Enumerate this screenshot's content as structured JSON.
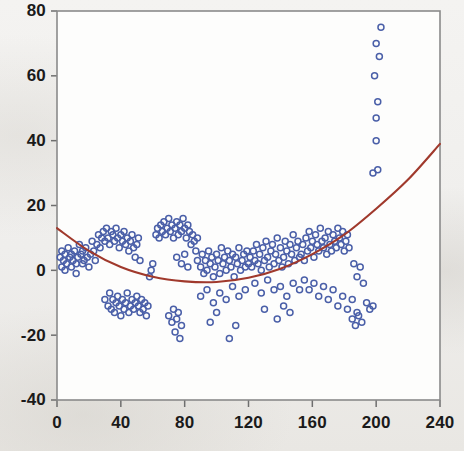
{
  "chart_data": {
    "type": "scatter",
    "title": "",
    "subtitle": "",
    "xlabel": "",
    "ylabel": "",
    "xlim": [
      0,
      240
    ],
    "ylim": [
      -40,
      80
    ],
    "xticks": [
      0,
      40,
      80,
      120,
      160,
      200,
      240
    ],
    "yticks": [
      -40,
      -20,
      0,
      20,
      40,
      60,
      80
    ],
    "xtick_labels": [
      "0",
      "40",
      "80",
      "120",
      "160",
      "200",
      "240"
    ],
    "ytick_labels": [
      "-40",
      "-20",
      "0",
      "20",
      "40",
      "60",
      "80"
    ],
    "grid": false,
    "legend": "none",
    "marker": {
      "shape": "open-circle",
      "color": "#4a5fa8",
      "fill": "none",
      "size_px": 6
    },
    "series": [
      {
        "name": "observations",
        "type": "scatter",
        "color": "#4a5fa8",
        "points": [
          [
            2,
            4
          ],
          [
            3,
            1
          ],
          [
            3,
            6
          ],
          [
            4,
            3
          ],
          [
            5,
            5
          ],
          [
            5,
            0
          ],
          [
            6,
            2
          ],
          [
            7,
            7
          ],
          [
            8,
            4
          ],
          [
            9,
            1
          ],
          [
            9,
            5
          ],
          [
            10,
            3
          ],
          [
            11,
            6
          ],
          [
            12,
            2
          ],
          [
            12,
            -1
          ],
          [
            13,
            4
          ],
          [
            14,
            8
          ],
          [
            15,
            5
          ],
          [
            16,
            2
          ],
          [
            16,
            6
          ],
          [
            17,
            3
          ],
          [
            18,
            7
          ],
          [
            19,
            4
          ],
          [
            20,
            1
          ],
          [
            21,
            5
          ],
          [
            22,
            9
          ],
          [
            23,
            6
          ],
          [
            24,
            3
          ],
          [
            25,
            8
          ],
          [
            26,
            11
          ],
          [
            27,
            7
          ],
          [
            28,
            10
          ],
          [
            29,
            12
          ],
          [
            30,
            9
          ],
          [
            31,
            13
          ],
          [
            32,
            10
          ],
          [
            33,
            8
          ],
          [
            34,
            12
          ],
          [
            35,
            11
          ],
          [
            36,
            9
          ],
          [
            37,
            13
          ],
          [
            38,
            10
          ],
          [
            39,
            7
          ],
          [
            40,
            11
          ],
          [
            41,
            9
          ],
          [
            42,
            12
          ],
          [
            43,
            8
          ],
          [
            44,
            10
          ],
          [
            45,
            6
          ],
          [
            46,
            9
          ],
          [
            47,
            11
          ],
          [
            48,
            7
          ],
          [
            49,
            4
          ],
          [
            50,
            8
          ],
          [
            51,
            10
          ],
          [
            52,
            3
          ],
          [
            30,
            -9
          ],
          [
            32,
            -11
          ],
          [
            33,
            -7
          ],
          [
            34,
            -12
          ],
          [
            35,
            -9
          ],
          [
            36,
            -13
          ],
          [
            37,
            -10
          ],
          [
            38,
            -8
          ],
          [
            39,
            -11
          ],
          [
            40,
            -14
          ],
          [
            41,
            -9
          ],
          [
            42,
            -12
          ],
          [
            43,
            -10
          ],
          [
            44,
            -7
          ],
          [
            45,
            -13
          ],
          [
            46,
            -11
          ],
          [
            47,
            -9
          ],
          [
            48,
            -12
          ],
          [
            49,
            -10
          ],
          [
            50,
            -8
          ],
          [
            51,
            -11
          ],
          [
            52,
            -13
          ],
          [
            53,
            -9
          ],
          [
            54,
            -12
          ],
          [
            55,
            -10
          ],
          [
            56,
            -14
          ],
          [
            57,
            -11
          ],
          [
            58,
            -2
          ],
          [
            59,
            0
          ],
          [
            60,
            2
          ],
          [
            62,
            11
          ],
          [
            63,
            13
          ],
          [
            64,
            10
          ],
          [
            65,
            14
          ],
          [
            66,
            12
          ],
          [
            67,
            15
          ],
          [
            68,
            11
          ],
          [
            69,
            13
          ],
          [
            70,
            16
          ],
          [
            71,
            12
          ],
          [
            72,
            14
          ],
          [
            73,
            10
          ],
          [
            74,
            13
          ],
          [
            75,
            15
          ],
          [
            76,
            11
          ],
          [
            77,
            14
          ],
          [
            78,
            12
          ],
          [
            79,
            16
          ],
          [
            80,
            13
          ],
          [
            81,
            10
          ],
          [
            82,
            14
          ],
          [
            83,
            12
          ],
          [
            84,
            8
          ],
          [
            85,
            11
          ],
          [
            86,
            9
          ],
          [
            87,
            6
          ],
          [
            88,
            10
          ],
          [
            75,
            4
          ],
          [
            78,
            2
          ],
          [
            80,
            5
          ],
          [
            82,
            1
          ],
          [
            70,
            -14
          ],
          [
            72,
            -16
          ],
          [
            73,
            -12
          ],
          [
            74,
            -19
          ],
          [
            75,
            -15
          ],
          [
            76,
            -13
          ],
          [
            77,
            -21
          ],
          [
            78,
            -17
          ],
          [
            88,
            3
          ],
          [
            90,
            1
          ],
          [
            91,
            5
          ],
          [
            92,
            -1
          ],
          [
            93,
            3
          ],
          [
            94,
            0
          ],
          [
            95,
            6
          ],
          [
            96,
            2
          ],
          [
            97,
            4
          ],
          [
            98,
            -2
          ],
          [
            99,
            1
          ],
          [
            100,
            5
          ],
          [
            101,
            3
          ],
          [
            102,
            -1
          ],
          [
            103,
            7
          ],
          [
            104,
            2
          ],
          [
            105,
            4
          ],
          [
            106,
            0
          ],
          [
            107,
            6
          ],
          [
            108,
            3
          ],
          [
            109,
            1
          ],
          [
            110,
            5
          ],
          [
            111,
            -2
          ],
          [
            112,
            4
          ],
          [
            113,
            2
          ],
          [
            114,
            7
          ],
          [
            115,
            0
          ],
          [
            116,
            3
          ],
          [
            117,
            5
          ],
          [
            118,
            1
          ],
          [
            119,
            6
          ],
          [
            120,
            2
          ],
          [
            90,
            -8
          ],
          [
            94,
            -6
          ],
          [
            98,
            -10
          ],
          [
            102,
            -7
          ],
          [
            106,
            -9
          ],
          [
            110,
            -5
          ],
          [
            114,
            -8
          ],
          [
            118,
            -6
          ],
          [
            96,
            -16
          ],
          [
            108,
            -21
          ],
          [
            112,
            -17
          ],
          [
            100,
            -13
          ],
          [
            121,
            4
          ],
          [
            122,
            1
          ],
          [
            123,
            6
          ],
          [
            124,
            3
          ],
          [
            125,
            8
          ],
          [
            126,
            2
          ],
          [
            127,
            5
          ],
          [
            128,
            0
          ],
          [
            129,
            7
          ],
          [
            130,
            3
          ],
          [
            131,
            9
          ],
          [
            132,
            4
          ],
          [
            133,
            1
          ],
          [
            134,
            6
          ],
          [
            135,
            8
          ],
          [
            136,
            2
          ],
          [
            137,
            5
          ],
          [
            138,
            10
          ],
          [
            139,
            3
          ],
          [
            140,
            7
          ],
          [
            141,
            1
          ],
          [
            142,
            4
          ],
          [
            143,
            9
          ],
          [
            144,
            6
          ],
          [
            145,
            2
          ],
          [
            146,
            8
          ],
          [
            147,
            5
          ],
          [
            148,
            11
          ],
          [
            149,
            3
          ],
          [
            150,
            7
          ],
          [
            151,
            9
          ],
          [
            152,
            4
          ],
          [
            124,
            -4
          ],
          [
            128,
            -7
          ],
          [
            132,
            -3
          ],
          [
            136,
            -6
          ],
          [
            140,
            -5
          ],
          [
            144,
            -8
          ],
          [
            148,
            -4
          ],
          [
            152,
            -6
          ],
          [
            130,
            -12
          ],
          [
            138,
            -15
          ],
          [
            142,
            -11
          ],
          [
            146,
            -13
          ],
          [
            153,
            5
          ],
          [
            154,
            8
          ],
          [
            155,
            3
          ],
          [
            156,
            10
          ],
          [
            157,
            6
          ],
          [
            158,
            12
          ],
          [
            159,
            7
          ],
          [
            160,
            9
          ],
          [
            161,
            4
          ],
          [
            162,
            11
          ],
          [
            163,
            8
          ],
          [
            164,
            6
          ],
          [
            165,
            13
          ],
          [
            166,
            9
          ],
          [
            167,
            7
          ],
          [
            168,
            10
          ],
          [
            169,
            5
          ],
          [
            170,
            12
          ],
          [
            171,
            8
          ],
          [
            172,
            6
          ],
          [
            173,
            11
          ],
          [
            174,
            9
          ],
          [
            175,
            7
          ],
          [
            176,
            13
          ],
          [
            177,
            10
          ],
          [
            178,
            8
          ],
          [
            179,
            12
          ],
          [
            180,
            6
          ],
          [
            181,
            9
          ],
          [
            182,
            11
          ],
          [
            183,
            7
          ],
          [
            155,
            -3
          ],
          [
            158,
            -6
          ],
          [
            161,
            -4
          ],
          [
            164,
            -8
          ],
          [
            167,
            -5
          ],
          [
            170,
            -9
          ],
          [
            173,
            -6
          ],
          [
            176,
            -11
          ],
          [
            179,
            -8
          ],
          [
            182,
            -12
          ],
          [
            185,
            -9
          ],
          [
            188,
            -13
          ],
          [
            186,
            2
          ],
          [
            188,
            -2
          ],
          [
            190,
            1
          ],
          [
            192,
            -4
          ],
          [
            194,
            -10
          ],
          [
            196,
            -12
          ],
          [
            198,
            -11
          ],
          [
            185,
            -15
          ],
          [
            187,
            -17
          ],
          [
            189,
            -14
          ],
          [
            191,
            -16
          ],
          [
            200,
            40
          ],
          [
            200,
            47
          ],
          [
            201,
            52
          ],
          [
            199,
            60
          ],
          [
            202,
            66
          ],
          [
            200,
            70
          ],
          [
            203,
            75
          ],
          [
            201,
            31
          ],
          [
            198,
            30
          ]
        ]
      }
    ],
    "fit": {
      "name": "quadratic-fit",
      "type": "curve",
      "color": "#a0392c",
      "description": "fitted quadratic regression curve",
      "equation_points": [
        [
          0,
          13
        ],
        [
          20,
          6
        ],
        [
          40,
          1
        ],
        [
          60,
          -2
        ],
        [
          80,
          -3.4
        ],
        [
          100,
          -3.6
        ],
        [
          120,
          -2.3
        ],
        [
          140,
          0.5
        ],
        [
          160,
          5
        ],
        [
          180,
          11
        ],
        [
          200,
          19
        ],
        [
          220,
          28
        ],
        [
          240,
          39
        ]
      ]
    }
  },
  "axes": {
    "plot_area": {
      "left": 57,
      "top": 11,
      "right": 440,
      "bottom": 400
    }
  }
}
